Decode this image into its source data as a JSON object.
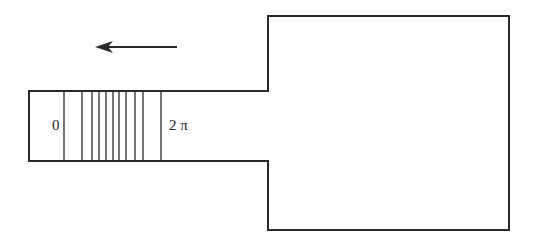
{
  "diagram": {
    "stroke_color": "#2a2a2a",
    "labels": {
      "left": "0",
      "right": "2 π"
    },
    "arrow": {
      "direction": "left",
      "x1": 177,
      "x2": 95,
      "y": 47
    },
    "outline": {
      "channel": {
        "left": 29,
        "right": 268,
        "top": 91,
        "bottom": 161
      },
      "chamber": {
        "left": 268,
        "right": 509,
        "top": 16,
        "bottom": 230
      }
    },
    "phase_lines_x": [
      64,
      82,
      92,
      99,
      106,
      113,
      119,
      126,
      135,
      143,
      161
    ]
  }
}
